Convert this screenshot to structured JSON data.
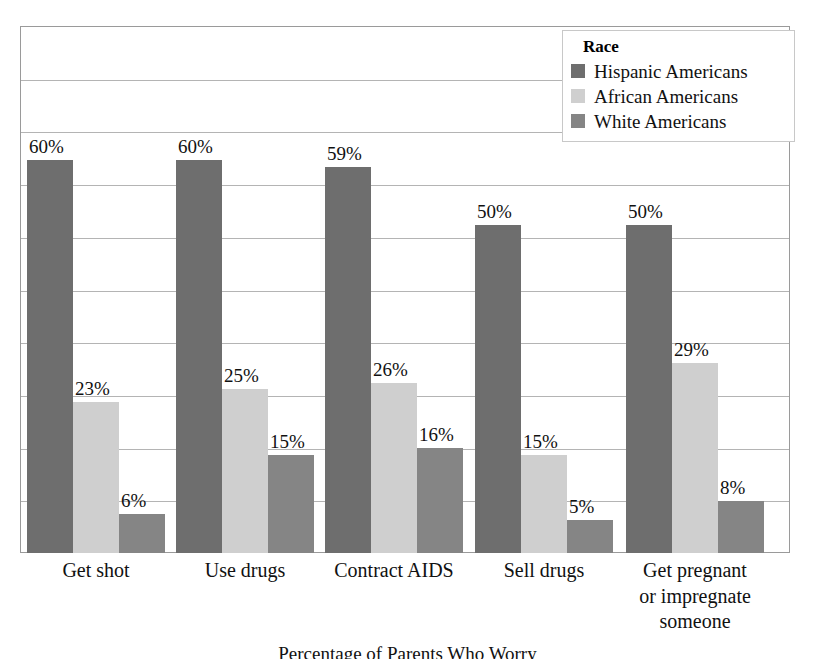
{
  "chart_data": {
    "type": "bar",
    "title": "",
    "caption": "Percentage of Parents Who Worry",
    "xlabel": "",
    "ylabel": "",
    "ylim": [
      0,
      80
    ],
    "grid": true,
    "gridline_count": 10,
    "legend_position": "top-right",
    "legend_title": "Race",
    "categories": [
      "Get shot",
      "Use drugs",
      "Contract AIDS",
      "Sell drugs",
      "Get pregnant or impregnate someone"
    ],
    "category_lines": [
      [
        "Get shot"
      ],
      [
        "Use drugs"
      ],
      [
        "Contract AIDS"
      ],
      [
        "Sell drugs"
      ],
      [
        "Get pregnant",
        "or impregnate",
        "someone"
      ]
    ],
    "series": [
      {
        "name": "Hispanic Americans",
        "color": "#6e6e6e",
        "values": [
          60,
          60,
          59,
          50,
          50
        ],
        "labels": [
          "60%",
          "60%",
          "59%",
          "50%",
          "50%"
        ]
      },
      {
        "name": "African Americans",
        "color": "#cfcfcf",
        "values": [
          23,
          25,
          26,
          15,
          29
        ],
        "labels": [
          "23%",
          "25%",
          "26%",
          "15%",
          "29%"
        ]
      },
      {
        "name": "White Americans",
        "color": "#858585",
        "values": [
          6,
          15,
          16,
          5,
          8
        ],
        "labels": [
          "6%",
          "15%",
          "16%",
          "5%",
          "8%"
        ]
      }
    ]
  },
  "legend": {
    "title": "Race",
    "items": [
      {
        "label": "Hispanic Americans",
        "color": "#6e6e6e"
      },
      {
        "label": "African Americans",
        "color": "#cfcfcf"
      },
      {
        "label": "White Americans",
        "color": "#858585"
      }
    ]
  },
  "colors": {
    "hispanic": "#6e6e6e",
    "african": "#cfcfcf",
    "white": "#858585",
    "frame": "#9a9a9a",
    "gridline": "#b4b4b4",
    "text": "#111111",
    "background": "#ffffff"
  },
  "caption": "Percentage of Parents Who Worry"
}
